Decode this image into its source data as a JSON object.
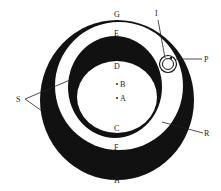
{
  "diagram": {
    "type": "concentric-rings-figure",
    "colors": {
      "ink": "#111111",
      "background": "#ffffff",
      "label": "#222222"
    },
    "labels": {
      "G": "G",
      "E": "E",
      "D": "D",
      "B": "B",
      "A": "A",
      "C": "C",
      "F": "F",
      "H": "H",
      "I": "I",
      "P": "P",
      "S": "S",
      "R": "R"
    },
    "elements": [
      {
        "id": "outer-ring",
        "description": "Outer black eccentric ring, thin at top (G) and thick at bottom (H)"
      },
      {
        "id": "middle-ring",
        "description": "Inner black eccentric ring, thick at top (E) and thin at bottom (C)"
      },
      {
        "id": "small-circle",
        "description": "Small double circle on right shoulder of outer ring, labeled P, with pointer I"
      },
      {
        "id": "points",
        "description": "Two dots labeled B and A in central white region"
      }
    ]
  }
}
